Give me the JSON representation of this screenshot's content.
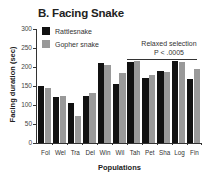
{
  "chart_data": {
    "type": "bar",
    "title": "B. Facing Snake",
    "xlabel": "Populations",
    "ylabel": "Facing duration (sec)",
    "ylim": [
      0,
      300
    ],
    "yticks": [
      0,
      50,
      100,
      150,
      200,
      250,
      300
    ],
    "categories": [
      "Fol",
      "Wel",
      "Tra",
      "Del",
      "Win",
      "Wil",
      "Tah",
      "Pet",
      "Sha",
      "Log",
      "Fin"
    ],
    "series": [
      {
        "name": "Rattlesnake",
        "color": "#111111",
        "values": [
          150,
          122,
          104,
          125,
          211,
          156,
          213,
          172,
          190,
          215,
          168
        ]
      },
      {
        "name": "Gopher snake",
        "color": "#999999",
        "values": [
          146,
          125,
          70,
          131,
          204,
          184,
          217,
          178,
          188,
          212,
          196
        ]
      }
    ],
    "legend_position": "upper-left",
    "grid": false,
    "annotations": [
      {
        "text": "Relaxed selection",
        "spans": [
          "Tah",
          "Fin"
        ]
      },
      {
        "text": "P < .0005",
        "spans": [
          "Tah",
          "Fin"
        ]
      }
    ]
  },
  "labels": {
    "title": "B. Facing Snake",
    "xlabel": "Populations",
    "ylabel": "Facing duration (sec)",
    "legend_rattle": "Rattlesnake",
    "legend_gopher": "Gopher snake",
    "annot_line1": "Relaxed selection",
    "annot_line2": "P < .0005"
  }
}
